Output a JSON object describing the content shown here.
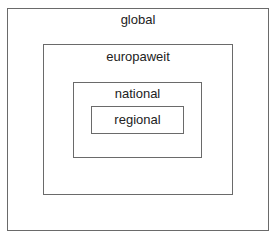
{
  "diagram": {
    "type": "nested-boxes",
    "levels": [
      {
        "label": "global"
      },
      {
        "label": "europaweit"
      },
      {
        "label": "national"
      },
      {
        "label": "regional"
      }
    ],
    "border_color": "#6a6a6a"
  }
}
